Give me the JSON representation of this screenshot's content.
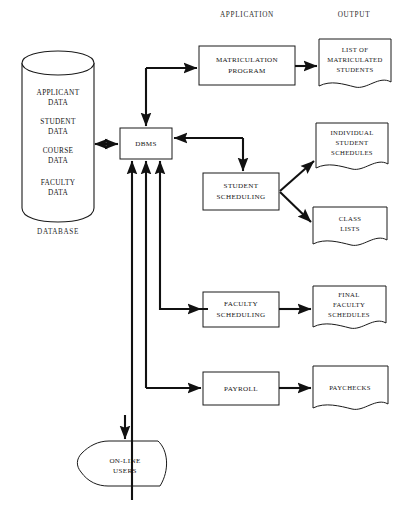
{
  "diagram": {
    "column_headers": [
      {
        "id": "application",
        "label": "APPLICATION"
      },
      {
        "id": "output",
        "label": "OUTPUT"
      }
    ],
    "database": {
      "caption": "DATABASE",
      "shape": "cylinder",
      "fields": [
        {
          "line1": "APPLICANT",
          "line2": "DATA"
        },
        {
          "line1": "STUDENT",
          "line2": "DATA"
        },
        {
          "line1": "COURSE",
          "line2": "DATA"
        },
        {
          "line1": "FACULTY",
          "line2": "DATA"
        }
      ]
    },
    "core": {
      "dbms": {
        "label": "DBMS",
        "shape": "rectangle"
      }
    },
    "applications": [
      {
        "id": "matriculation-program",
        "line1": "MATRICULATION",
        "line2": "PROGRAM",
        "shape": "rectangle"
      },
      {
        "id": "student-scheduling",
        "line1": "STUDENT",
        "line2": "SCHEDULING",
        "shape": "rectangle"
      },
      {
        "id": "faculty-scheduling",
        "line1": "FACULTY",
        "line2": "SCHEDULING",
        "shape": "rectangle"
      },
      {
        "id": "payroll",
        "line1": "PAYROLL",
        "line2": "",
        "shape": "rectangle"
      }
    ],
    "outputs": [
      {
        "id": "list-matriculated-students",
        "line1": "LIST OF",
        "line2": "MATRICULATED",
        "line3": "STUDENTS",
        "shape": "document"
      },
      {
        "id": "individual-student-schedules",
        "line1": "INDIVIDUAL",
        "line2": "STUDENT",
        "line3": "SCHEDULES",
        "shape": "document"
      },
      {
        "id": "class-lists",
        "line1": "CLASS",
        "line2": "LISTS",
        "line3": "",
        "shape": "document"
      },
      {
        "id": "final-faculty-schedules",
        "line1": "FINAL",
        "line2": "FACULTY",
        "line3": "SCHEDULES",
        "shape": "document"
      },
      {
        "id": "paychecks",
        "line1": "PAYCHECKS",
        "line2": "",
        "line3": "",
        "shape": "document"
      }
    ],
    "users": {
      "id": "on-line-users",
      "line1": "ON-LINE",
      "line2": "USERS",
      "shape": "pentagon"
    },
    "colors": {
      "stroke": "#1a1a1a",
      "connector": "#111111",
      "background": "#ffffff",
      "text": "#161616"
    }
  }
}
